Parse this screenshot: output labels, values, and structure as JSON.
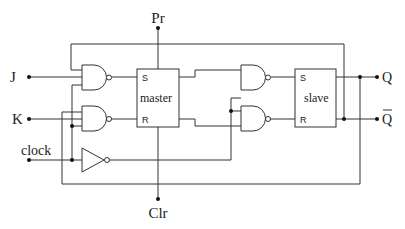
{
  "diagram": {
    "title": "",
    "type": "JK master-slave flip-flop logic diagram",
    "inputs": {
      "j": "J",
      "k": "K",
      "clock": "clock",
      "preset": "Pr",
      "clear": "Clr"
    },
    "outputs": {
      "q": "Q",
      "q_bar": "Q"
    },
    "blocks": {
      "master": {
        "label": "master",
        "s_pin": "S",
        "r_pin": "R"
      },
      "slave": {
        "label": "slave",
        "s_pin": "S",
        "r_pin": "R"
      }
    },
    "gates": [
      {
        "id": "nand-j",
        "type": "NAND"
      },
      {
        "id": "nand-k",
        "type": "NAND"
      },
      {
        "id": "inverter-clock",
        "type": "NOT"
      },
      {
        "id": "nand-slave-s",
        "type": "NAND"
      },
      {
        "id": "nand-slave-r",
        "type": "NAND"
      }
    ],
    "colors": {
      "line": "#333333",
      "background": "#ffffff"
    }
  }
}
